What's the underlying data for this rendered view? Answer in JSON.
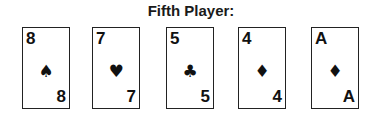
{
  "title": "Fifth Player:",
  "cards": [
    {
      "rank": "8",
      "suit": "♠",
      "suit_name": "spades"
    },
    {
      "rank": "7",
      "suit": "♥",
      "suit_name": "hearts"
    },
    {
      "rank": "5",
      "suit": "♣",
      "suit_name": "clubs"
    },
    {
      "rank": "4",
      "suit": "♦",
      "suit_name": "diamonds"
    },
    {
      "rank": "A",
      "suit": "♦",
      "suit_name": "diamonds"
    }
  ]
}
